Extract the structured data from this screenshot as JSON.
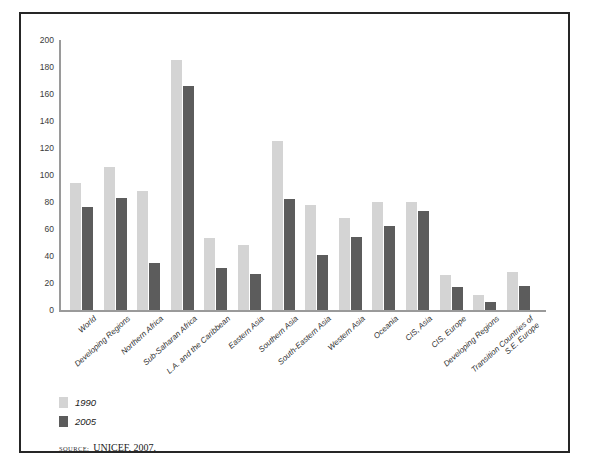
{
  "chart_data": {
    "type": "bar",
    "title": "",
    "xlabel": "",
    "ylabel": "",
    "ylim": [
      0,
      200
    ],
    "yticks": [
      0,
      20,
      40,
      60,
      80,
      100,
      120,
      140,
      160,
      180,
      200
    ],
    "grid": false,
    "legend_position": "below-left",
    "categories": [
      "World",
      "Developing Regions",
      "Northern Africa",
      "Sub-Saharan Africa",
      "L.A. and the Caribbean",
      "Eastern Asia",
      "Southern Asia",
      "South-Eastern Asia",
      "Western Asia",
      "Oceania",
      "CIS, Asia",
      "CIS, Europe",
      "Developing Regions",
      "Transition Countries of\nS.E. Europe"
    ],
    "series": [
      {
        "name": "1990",
        "color": "#d4d4d4",
        "values": [
          94,
          106,
          88,
          185,
          53,
          48,
          125,
          78,
          68,
          80,
          80,
          26,
          11,
          28
        ]
      },
      {
        "name": "2005",
        "color": "#5c5c5c",
        "values": [
          76,
          83,
          35,
          166,
          31,
          27,
          82,
          41,
          54,
          62,
          73,
          17,
          6,
          18
        ]
      }
    ]
  },
  "legend": {
    "items": [
      {
        "label": "1990"
      },
      {
        "label": "2005"
      }
    ]
  },
  "source": {
    "kicker": "Source:",
    "text": "UNICEF, 2007."
  }
}
